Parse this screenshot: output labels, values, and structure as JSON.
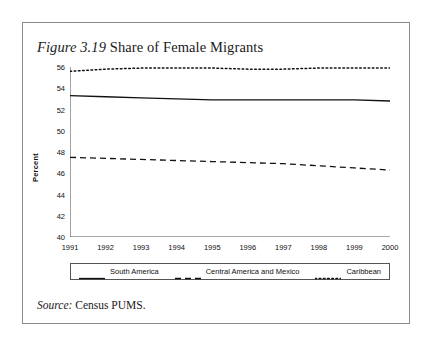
{
  "figure": {
    "number_label": "Figure 3.19",
    "title_text": " Share of Female Migrants",
    "source_lead": "Source:",
    "source_text": " Census PUMS."
  },
  "axes": {
    "y_axis_title": "Percent"
  },
  "legend": {
    "entries": [
      {
        "label": "South America",
        "style": "solid"
      },
      {
        "label": "Central America and Mexico",
        "style": "dashed"
      },
      {
        "label": "Caribbean",
        "style": "dotted"
      }
    ]
  },
  "chart_data": {
    "type": "line",
    "title": "Figure 3.19 Share of Female Migrants",
    "xlabel": "",
    "ylabel": "Percent",
    "xlim": [
      1991,
      2000
    ],
    "ylim": [
      40,
      56
    ],
    "grid": false,
    "legend_position": "bottom",
    "x": [
      1991,
      1992,
      1993,
      1994,
      1995,
      1996,
      1997,
      1998,
      1999,
      2000
    ],
    "x_tick_labels": [
      "1991",
      "1992",
      "1993",
      "1994",
      "1995",
      "1996",
      "1997",
      "1998",
      "1999",
      "2000"
    ],
    "y_ticks": [
      40,
      42,
      44,
      46,
      48,
      50,
      52,
      54,
      56
    ],
    "y_tick_labels": [
      "40",
      "42",
      "44",
      "46",
      "48",
      "50",
      "52",
      "54",
      "56"
    ],
    "series": [
      {
        "name": "South America",
        "style": "solid",
        "color": "#111111",
        "values": [
          53.3,
          53.2,
          53.1,
          53.0,
          52.9,
          52.9,
          52.9,
          52.9,
          52.9,
          52.8
        ]
      },
      {
        "name": "Central America and Mexico",
        "style": "dashed",
        "color": "#111111",
        "values": [
          47.5,
          47.4,
          47.3,
          47.2,
          47.1,
          47.0,
          46.9,
          46.7,
          46.5,
          46.3
        ]
      },
      {
        "name": "Caribbean",
        "style": "dotted",
        "color": "#111111",
        "values": [
          55.6,
          55.8,
          55.9,
          55.9,
          55.9,
          55.8,
          55.8,
          55.9,
          55.9,
          55.9
        ]
      }
    ]
  }
}
